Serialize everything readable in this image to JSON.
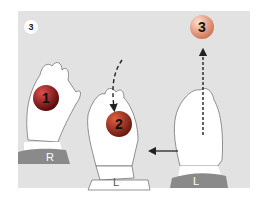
{
  "step_number": "3",
  "balls": [
    {
      "label": "1",
      "color": "#a11a1a"
    },
    {
      "label": "2",
      "color": "#b23a2a"
    },
    {
      "label": "3",
      "color": "#f0a890"
    }
  ],
  "hands": [
    {
      "label": "R"
    },
    {
      "label": "L"
    },
    {
      "label": "L"
    }
  ],
  "colors": {
    "background": "#e2e2e2",
    "sleeve": "#8a8a8a"
  }
}
